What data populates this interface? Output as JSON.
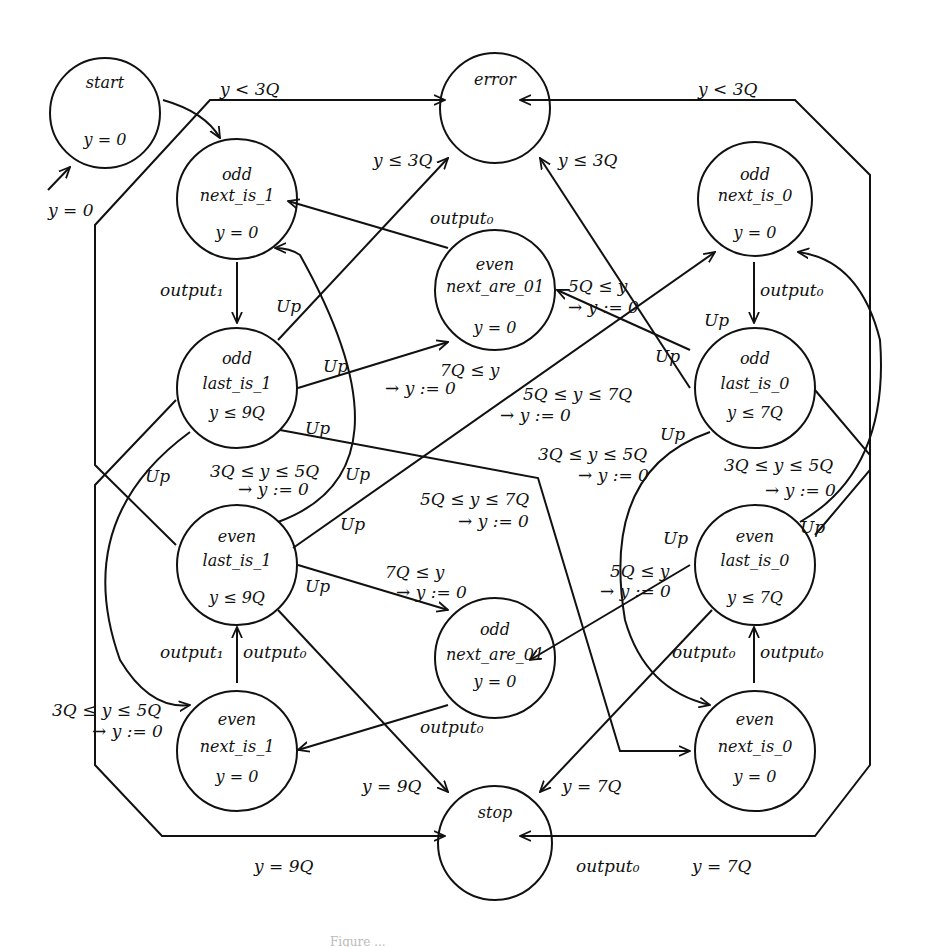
{
  "figure": {
    "type": "state-machine",
    "caption": "Figure ..."
  },
  "nodes": {
    "start": {
      "l1": "start",
      "l2": "",
      "l3": "y = 0"
    },
    "error": {
      "l1": "error",
      "l2": "",
      "l3": ""
    },
    "odd_next_is_1": {
      "l1": "odd",
      "l2": "next_is_1",
      "l3": "y = 0"
    },
    "even_next_are_01": {
      "l1": "even",
      "l2": "next_are_01",
      "l3": "y = 0"
    },
    "odd_next_is_0": {
      "l1": "odd",
      "l2": "next_is_0",
      "l3": "y = 0"
    },
    "odd_last_is_1": {
      "l1": "odd",
      "l2": "last_is_1",
      "l3": "y ≤ 9Q"
    },
    "odd_last_is_0": {
      "l1": "odd",
      "l2": "last_is_0",
      "l3": "y ≤ 7Q"
    },
    "even_last_is_1": {
      "l1": "even",
      "l2": "last_is_1",
      "l3": "y ≤ 9Q"
    },
    "even_last_is_0": {
      "l1": "even",
      "l2": "last_is_0",
      "l3": "y ≤ 7Q"
    },
    "odd_next_are_01": {
      "l1": "odd",
      "l2": "next_are_01",
      "l3": "y = 0"
    },
    "even_next_is_1": {
      "l1": "even",
      "l2": "next_is_1",
      "l3": "y = 0"
    },
    "even_next_is_0": {
      "l1": "even",
      "l2": "next_is_0",
      "l3": "y = 0"
    },
    "stop": {
      "l1": "stop",
      "l2": "",
      "l3": ""
    }
  },
  "labels": {
    "init": "y = 0",
    "top_left_lt3q": "y < 3Q",
    "top_right_lt3q": "y < 3Q",
    "le3q_left": "y ≤ 3Q",
    "le3q_right": "y ≤ 3Q",
    "output0_top": "output₀",
    "output1_left": "output₁",
    "output0_right": "output₀",
    "up_1": "Up",
    "up_2": "Up",
    "up_3": "Up",
    "up_4": "Up",
    "up_5": "Up",
    "up_6": "Up",
    "up_7": "Up",
    "up_8": "Up",
    "up_9": "Up",
    "up_10": "Up",
    "up_11": "Up",
    "up_12": "Up",
    "g_5q_le_y_a": "5Q ≤ y",
    "r_a": "→ y := 0",
    "g_7q_le_y_a": "7Q ≤ y",
    "r_b": "→ y := 0",
    "g_5q_7q_a": "5Q ≤ y ≤ 7Q",
    "r_c": "→ y := 0",
    "g_3q_5q_a": "3Q ≤ y ≤ 5Q",
    "r_d": "→ y := 0",
    "g_3q_5q_b": "3Q ≤ y ≤ 5Q",
    "r_e": "→ y := 0",
    "g_3q_5q_c": "3Q ≤ y ≤ 5Q",
    "r_f": "→ y := 0",
    "g_5q_7q_b": "5Q ≤ y ≤ 7Q",
    "r_g": "→ y := 0",
    "g_7q_le_y_b": "7Q ≤ y",
    "r_h": "→ y := 0",
    "g_5q_le_y_b": "5Q ≤ y",
    "r_i": "→ y := 0",
    "g_3q_5q_d": "3Q ≤ y ≤ 5Q",
    "r_j": "→ y := 0",
    "out1_bl": "output₁",
    "out0_bl": "output₀",
    "out0_mid": "output₀",
    "out0_br1": "output₀",
    "out0_br2": "output₀",
    "y9q_a": "y = 9Q",
    "y7q_a": "y = 7Q",
    "y9q_b": "y = 9Q",
    "out0_bottom": "output₀",
    "y7q_b": "y = 7Q"
  },
  "colors": {
    "stroke": "#111111",
    "background": "#ffffff"
  }
}
